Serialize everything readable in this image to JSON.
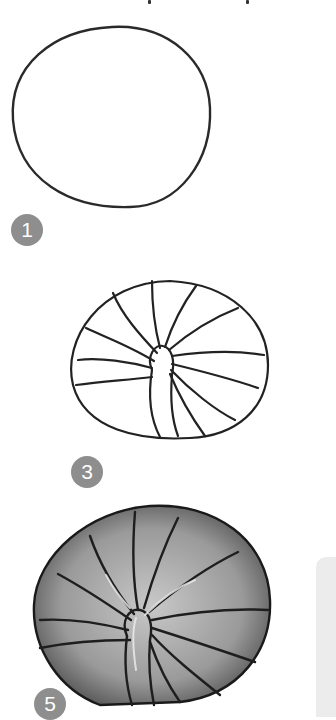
{
  "steps": [
    {
      "number": "1",
      "label": "Step 1 - circle outline"
    },
    {
      "number": "3",
      "label": "Step 3 - segmented spiral outline"
    },
    {
      "number": "5",
      "label": "Step 5 - shaded spiral"
    }
  ],
  "colors": {
    "badge": "#8e8e8e",
    "badge_text": "#ffffff",
    "line": "#222222",
    "panel": "#ececec"
  }
}
